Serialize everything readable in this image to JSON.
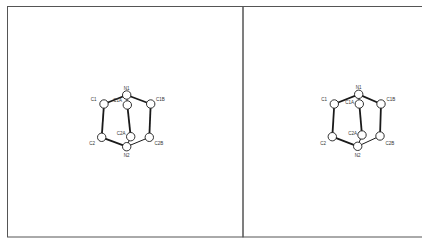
{
  "figure": {
    "type": "stereo-pair",
    "frame_color": "#555555",
    "bond_color": "#1a1a1a",
    "atom_fill": "#ffffff"
  },
  "panels": [
    {
      "name": "left-view",
      "atoms": [
        {
          "label": "N1",
          "x": 126.7,
          "y": 95.0,
          "lx": 126.7,
          "ly": 89.5,
          "anchor": "middle"
        },
        {
          "label": "C1",
          "x": 104.0,
          "y": 104.0,
          "lx": 96.5,
          "ly": 100.5,
          "anchor": "end"
        },
        {
          "label": "C1B",
          "x": 150.7,
          "y": 104.0,
          "lx": 156.0,
          "ly": 100.5,
          "anchor": "start"
        },
        {
          "label": "C1A",
          "x": 127.3,
          "y": 105.0,
          "lx": 122.0,
          "ly": 102.0,
          "anchor": "end"
        },
        {
          "label": "C2",
          "x": 101.7,
          "y": 137.3,
          "lx": 95.0,
          "ly": 145.0,
          "anchor": "end"
        },
        {
          "label": "C2A",
          "x": 130.7,
          "y": 136.7,
          "lx": 125.5,
          "ly": 134.5,
          "anchor": "end"
        },
        {
          "label": "C2B",
          "x": 149.3,
          "y": 137.3,
          "lx": 154.5,
          "ly": 145.0,
          "anchor": "start"
        },
        {
          "label": "N2",
          "x": 126.7,
          "y": 146.7,
          "lx": 126.7,
          "ly": 157.0,
          "anchor": "middle"
        }
      ]
    },
    {
      "name": "right-view",
      "atoms": [
        {
          "label": "N1",
          "x": 358.7,
          "y": 94.3,
          "lx": 358.7,
          "ly": 89.0,
          "anchor": "middle"
        },
        {
          "label": "C1",
          "x": 334.3,
          "y": 104.0,
          "lx": 327.0,
          "ly": 100.5,
          "anchor": "end"
        },
        {
          "label": "C1B",
          "x": 381.0,
          "y": 104.0,
          "lx": 386.5,
          "ly": 100.5,
          "anchor": "start"
        },
        {
          "label": "C1A",
          "x": 359.3,
          "y": 104.0,
          "lx": 354.0,
          "ly": 104.0,
          "anchor": "end"
        },
        {
          "label": "C2",
          "x": 332.3,
          "y": 136.7,
          "lx": 326.0,
          "ly": 144.5,
          "anchor": "end"
        },
        {
          "label": "C2A",
          "x": 362.0,
          "y": 135.0,
          "lx": 357.0,
          "ly": 135.0,
          "anchor": "end"
        },
        {
          "label": "C2B",
          "x": 380.0,
          "y": 136.0,
          "lx": 385.5,
          "ly": 144.5,
          "anchor": "start"
        },
        {
          "label": "N2",
          "x": 357.7,
          "y": 146.3,
          "lx": 357.7,
          "ly": 156.5,
          "anchor": "middle"
        }
      ]
    }
  ],
  "bonds": [
    [
      "N1",
      "C1",
      "thick"
    ],
    [
      "N1",
      "C1B",
      "thick"
    ],
    [
      "N1",
      "C1A",
      "thin"
    ],
    [
      "C1",
      "C2",
      "thick"
    ],
    [
      "C1B",
      "C2B",
      "thick"
    ],
    [
      "C1A",
      "C2A",
      "thick"
    ],
    [
      "C2",
      "N2",
      "thick"
    ],
    [
      "C2B",
      "N2",
      "thin"
    ],
    [
      "C2A",
      "N2",
      "thin"
    ]
  ]
}
